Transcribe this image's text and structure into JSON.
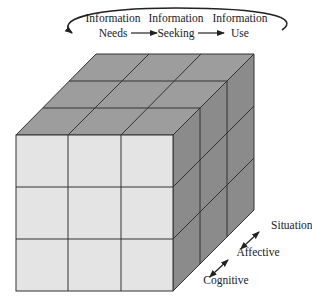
{
  "diagram": {
    "process": {
      "stages": [
        {
          "line1": "Information",
          "line2": "Needs"
        },
        {
          "line1": "Information",
          "line2": "Seeking"
        },
        {
          "line1": "Information",
          "line2": "Use"
        }
      ]
    },
    "dimensions": {
      "labels": [
        "Situational",
        "Affective",
        "Cognitive"
      ]
    },
    "cube": {
      "grid": "3x3x3",
      "colors": {
        "front": "#e4e4e4",
        "top": "#9d9d9d",
        "right": "#8b8b8b",
        "lines": "#333333"
      }
    }
  }
}
